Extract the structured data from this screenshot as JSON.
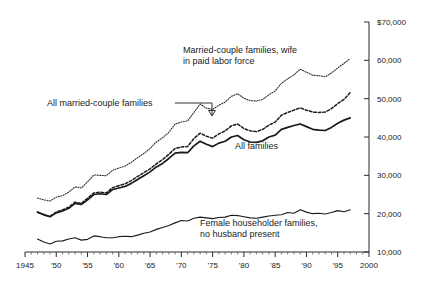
{
  "chart_data": {
    "type": "line",
    "title": "",
    "xlabel": "",
    "ylabel": "",
    "xlim": [
      1945,
      2000
    ],
    "ylim": [
      10000,
      70000
    ],
    "grid": false,
    "legend_position": "inline-annotations",
    "x_ticks": [
      "1945",
      "'50",
      "'55",
      "'60",
      "'65",
      "'70",
      "'75",
      "'80",
      "'85",
      "'90",
      "'95",
      "2000"
    ],
    "x_tick_values": [
      1945,
      1950,
      1955,
      1960,
      1965,
      1970,
      1975,
      1980,
      1985,
      1990,
      1995,
      2000
    ],
    "y_ticks": [
      "$70,000",
      "60,000",
      "50,000",
      "40,000",
      "30,000",
      "20,000",
      "10,000"
    ],
    "y_tick_values": [
      70000,
      60000,
      50000,
      40000,
      30000,
      20000,
      10000
    ],
    "x": [
      1947,
      1948,
      1949,
      1950,
      1951,
      1952,
      1953,
      1954,
      1955,
      1956,
      1957,
      1958,
      1959,
      1960,
      1961,
      1962,
      1963,
      1964,
      1965,
      1966,
      1967,
      1968,
      1969,
      1970,
      1971,
      1972,
      1973,
      1974,
      1975,
      1976,
      1977,
      1978,
      1979,
      1980,
      1981,
      1982,
      1983,
      1984,
      1985,
      1986,
      1987,
      1988,
      1989,
      1990,
      1991,
      1992,
      1993,
      1994,
      1995,
      1996,
      1997
    ],
    "series": [
      {
        "name": "Married-couple families, wife in paid labor force",
        "style": "dotted",
        "values": [
          24100,
          23600,
          23300,
          24300,
          24700,
          25600,
          27000,
          26700,
          28300,
          30100,
          30000,
          29900,
          31300,
          31900,
          32400,
          33400,
          34600,
          35700,
          37000,
          38700,
          39800,
          41200,
          43400,
          43900,
          44200,
          46400,
          48600,
          47500,
          47200,
          48300,
          49100,
          50600,
          51300,
          50100,
          49500,
          49400,
          49800,
          51000,
          52000,
          54000,
          55200,
          56200,
          57700,
          56900,
          56100,
          56000,
          55700,
          56700,
          58000,
          59200,
          60500
        ]
      },
      {
        "name": "All married-couple families",
        "style": "dashed",
        "values": [
          20400,
          19800,
          19300,
          20400,
          21000,
          21700,
          23000,
          22700,
          24000,
          25400,
          25600,
          25400,
          26800,
          27300,
          27800,
          28600,
          29700,
          30700,
          31700,
          33000,
          34100,
          35500,
          37000,
          37400,
          37500,
          39600,
          41000,
          40200,
          39700,
          40800,
          41600,
          42900,
          43400,
          42200,
          41600,
          41400,
          42000,
          43100,
          43900,
          45700,
          46400,
          47000,
          47600,
          47000,
          46500,
          46400,
          46500,
          47400,
          48700,
          49800,
          51600
        ]
      },
      {
        "name": "All families",
        "style": "solid-bold",
        "values": [
          20400,
          19700,
          19200,
          20200,
          20700,
          21400,
          22700,
          22400,
          23600,
          25000,
          25200,
          25000,
          26300,
          26700,
          27100,
          27900,
          28900,
          29900,
          30900,
          32200,
          33100,
          34400,
          35800,
          36000,
          35900,
          37700,
          38900,
          38100,
          37500,
          38400,
          38900,
          40000,
          40400,
          39300,
          38700,
          38600,
          39000,
          40000,
          40500,
          42000,
          42500,
          43000,
          43400,
          42700,
          42000,
          41800,
          41700,
          42500,
          43600,
          44400,
          45000
        ]
      },
      {
        "name": "Female householder families, no husband present",
        "style": "solid-thin",
        "values": [
          13400,
          12600,
          12100,
          12800,
          12900,
          13400,
          13700,
          13100,
          13300,
          14200,
          14000,
          13700,
          13700,
          14000,
          14100,
          14000,
          14400,
          14900,
          15200,
          15900,
          16400,
          16900,
          17600,
          18200,
          18100,
          18800,
          19100,
          18900,
          18700,
          19000,
          19100,
          19600,
          19500,
          19200,
          18900,
          18800,
          19100,
          19400,
          19600,
          19700,
          20300,
          20100,
          21000,
          20400,
          20000,
          20100,
          19900,
          20300,
          20800,
          20500,
          21000
        ]
      }
    ],
    "annotations": [
      {
        "name": "wife-label",
        "text_lines": [
          "Married-couple families, wife",
          "in paid labor force"
        ]
      },
      {
        "name": "married-label",
        "text_lines": [
          "All married-couple families"
        ]
      },
      {
        "name": "all-families-label",
        "text_lines": [
          "All families"
        ]
      },
      {
        "name": "female-householder-label",
        "text_lines": [
          "Female householder families,",
          "no husband present"
        ]
      }
    ]
  },
  "labels": {
    "wife_line1": "Married-couple families, wife",
    "wife_line2": "in paid labor force",
    "married": "All married-couple families",
    "all_families": "All families",
    "female_line1": "Female householder families,",
    "female_line2": "no husband present"
  },
  "colors": {
    "ink": "#1a1a1a",
    "background": "#ffffff"
  }
}
